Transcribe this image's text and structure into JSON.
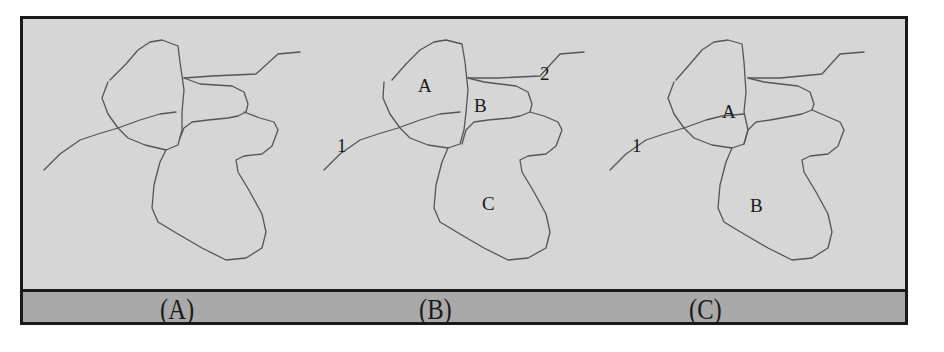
{
  "figure": {
    "panels": [
      {
        "id": "A",
        "caption": "(A)",
        "region_labels": [],
        "line_labels": []
      },
      {
        "id": "B",
        "caption": "(B)",
        "region_labels": [
          "A",
          "B",
          "C"
        ],
        "line_labels": [
          "1",
          "2"
        ]
      },
      {
        "id": "C",
        "caption": "(C)",
        "region_labels": [
          "A",
          "B"
        ],
        "line_labels": [
          "1"
        ]
      }
    ],
    "colors": {
      "panel_background": "#d6d6d6",
      "caption_strip": "#a9a9a9",
      "border": "#1a1a1a",
      "outline": "#555555"
    }
  }
}
